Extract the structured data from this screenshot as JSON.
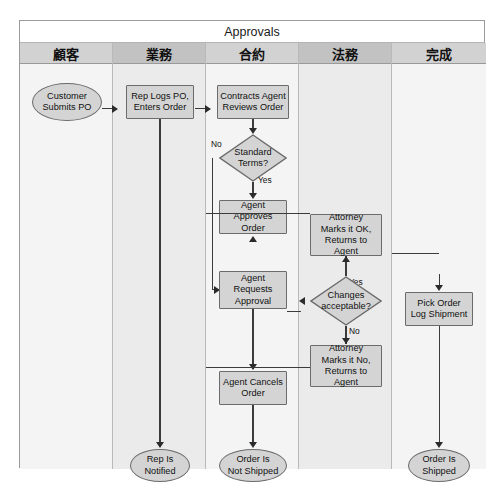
{
  "diagram": {
    "type": "cross-functional-flowchart",
    "pool_title": "Approvals",
    "lanes": [
      {
        "id": "customer",
        "label": "顧客"
      },
      {
        "id": "sales",
        "label": "業務"
      },
      {
        "id": "contract",
        "label": "合約"
      },
      {
        "id": "legal",
        "label": "法務"
      },
      {
        "id": "complete",
        "label": "完成"
      }
    ],
    "nodes": [
      {
        "id": "n1",
        "lane": "customer",
        "shape": "terminator",
        "text": "Customer\nSubmits PO"
      },
      {
        "id": "n2",
        "lane": "sales",
        "shape": "process",
        "text": "Rep Logs PO,\nEnters Order"
      },
      {
        "id": "n3",
        "lane": "contract",
        "shape": "process",
        "text": "Contracts Agent\nReviews Order"
      },
      {
        "id": "n4",
        "lane": "contract",
        "shape": "decision",
        "text": "Standard\nTerms?"
      },
      {
        "id": "n5",
        "lane": "contract",
        "shape": "process",
        "text": "Agent Approves\nOrder"
      },
      {
        "id": "n6",
        "lane": "contract",
        "shape": "process",
        "text": "Agent\nRequests\nApproval"
      },
      {
        "id": "n7",
        "lane": "contract",
        "shape": "process",
        "text": "Agent Cancels\nOrder"
      },
      {
        "id": "n8",
        "lane": "contract",
        "shape": "terminator",
        "text": "Order Is\nNot Shipped"
      },
      {
        "id": "n9",
        "lane": "legal",
        "shape": "process",
        "text": "Attorney\nMarks it OK,\nReturns to Agent"
      },
      {
        "id": "n10",
        "lane": "legal",
        "shape": "decision",
        "text": "Changes\nacceptable?"
      },
      {
        "id": "n11",
        "lane": "legal",
        "shape": "process",
        "text": "Attorney\nMarks it No,\nReturns to Agent"
      },
      {
        "id": "n12",
        "lane": "complete",
        "shape": "process",
        "text": "Pick Order\nLog Shipment"
      },
      {
        "id": "n13",
        "lane": "complete",
        "shape": "terminator",
        "text": "Order Is\nShipped"
      },
      {
        "id": "n14",
        "lane": "sales",
        "shape": "terminator",
        "text": "Rep Is\nNotified"
      }
    ],
    "branch_labels": {
      "standard_no": "No",
      "standard_yes": "Yes",
      "changes_yes": "Yes",
      "changes_no": "No"
    },
    "colors": {
      "node_fill": "#d4d4d4",
      "node_stroke": "#6b6b6b",
      "lane_tint_light": "#f4f4f4",
      "lane_tint_dark": "#ebebeb",
      "lane_head_light": "#d2d2d2",
      "lane_head_dark": "#c2c2c2",
      "connector": "#3b3b3b",
      "frame": "#9a9a9a"
    }
  }
}
